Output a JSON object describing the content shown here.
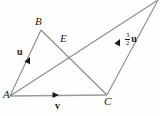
{
  "figure": {
    "background_color": "#fefefe",
    "line_color": "#8a8a8a",
    "text_color": "#1a1a1a",
    "points": {
      "A": {
        "label": "A",
        "x": 10,
        "y": 96,
        "label_x": 3,
        "label_y": 90
      },
      "B": {
        "label": "B",
        "x": 41,
        "y": 30,
        "label_x": 35,
        "label_y": 16
      },
      "C": {
        "label": "C",
        "x": 107,
        "y": 95,
        "label_x": 104,
        "label_y": 96
      },
      "E": {
        "label": "E",
        "x": 58,
        "y": 38,
        "label_x": 60,
        "label_y": 34
      },
      "D": {
        "label": "",
        "x": 158,
        "y": 0,
        "label_x": 0,
        "label_y": 0
      }
    },
    "segments": [
      {
        "name": "segment-a-b",
        "from": "A",
        "to": "B"
      },
      {
        "name": "segment-b-c",
        "from": "B",
        "to": "C"
      },
      {
        "name": "segment-a-c",
        "from": "A",
        "to": "C"
      },
      {
        "name": "segment-a-d",
        "from": "A",
        "to": "D"
      },
      {
        "name": "segment-c-d",
        "from": "C",
        "to": "D"
      }
    ],
    "vectors": [
      {
        "name": "vector-u",
        "label": "u",
        "label_x": 17,
        "label_y": 47,
        "arrow_x": 30,
        "arrow_y": 57,
        "arrow_angle_deg": -64.8,
        "on_segment": "segment-a-b"
      },
      {
        "name": "vector-v",
        "label": "v",
        "label_x": 55,
        "label_y": 101,
        "arrow_x": 57,
        "arrow_y": 95,
        "arrow_angle_deg": 0,
        "on_segment": "segment-a-c"
      }
    ],
    "scaled_vector": {
      "name": "vector-three-halves-u",
      "numerator": "3",
      "denominator": "2",
      "symbol": "u",
      "label_x": 125,
      "label_y": 33,
      "arrow_x": 120,
      "arrow_y": 40,
      "arrow_angle_deg": -64.5,
      "on_segment": "segment-c-d"
    }
  }
}
